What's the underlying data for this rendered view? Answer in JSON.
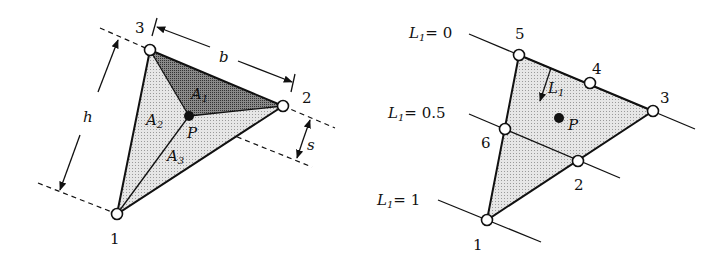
{
  "colors": {
    "stroke": "#111111",
    "light_fill": "#d9d9d9",
    "dark_fill": "#7a7a7a",
    "background": "#ffffff"
  },
  "left_diagram": {
    "nodes": [
      {
        "id": "1",
        "label": "1"
      },
      {
        "id": "2",
        "label": "2"
      },
      {
        "id": "3",
        "label": "3"
      }
    ],
    "point_label": "P",
    "areas": [
      {
        "name": "A",
        "sub": "1"
      },
      {
        "name": "A",
        "sub": "2"
      },
      {
        "name": "A",
        "sub": "3"
      }
    ],
    "dimensions": {
      "base": "b",
      "height": "h",
      "distance": "s"
    }
  },
  "right_diagram": {
    "nodes": [
      {
        "id": "1",
        "label": "1"
      },
      {
        "id": "2",
        "label": "2"
      },
      {
        "id": "3",
        "label": "3"
      },
      {
        "id": "4",
        "label": "4"
      },
      {
        "id": "5",
        "label": "5"
      },
      {
        "id": "6",
        "label": "6"
      }
    ],
    "point_label": "P",
    "direction_label": {
      "name": "L",
      "sub": "1"
    },
    "contours": [
      {
        "name": "L",
        "sub": "1",
        "eq": "= 0"
      },
      {
        "name": "L",
        "sub": "1",
        "eq": "= 0.5"
      },
      {
        "name": "L",
        "sub": "1",
        "eq": "= 1"
      }
    ]
  }
}
